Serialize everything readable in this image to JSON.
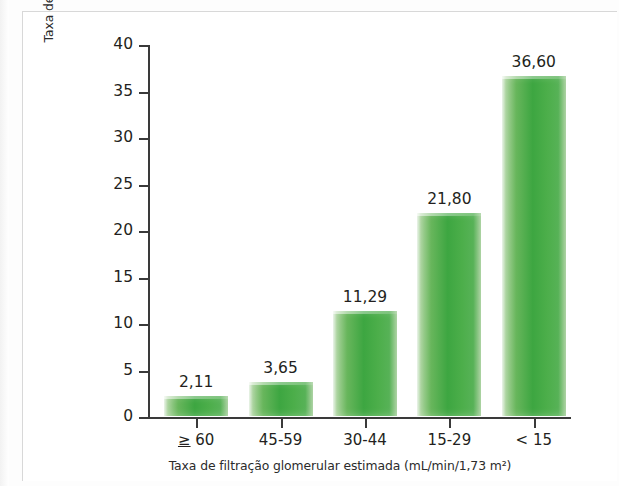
{
  "chart_data": {
    "type": "bar",
    "title": "",
    "categories": [
      "≥ 60",
      "45-59",
      "30-44",
      "15-29",
      "< 15"
    ],
    "values": [
      2.11,
      3.65,
      11.29,
      21.8,
      36.6
    ],
    "value_labels": [
      "2,11",
      "3,65",
      "11,29",
      "21,80",
      "36,60"
    ],
    "xlabel": "Taxa de filtração glomerular estimada (mL/min/1,73 m²)",
    "ylabel": "Taxa de eventos cardiovasculares ajustados para a idade\n(100 pessoas/ano)",
    "ylim": [
      0,
      40
    ],
    "ytick_labels": [
      "0",
      "5",
      "10",
      "15",
      "20",
      "25",
      "30",
      "35",
      "40"
    ],
    "ytick_values": [
      0,
      5,
      10,
      15,
      20,
      25,
      30,
      35,
      40
    ],
    "grid": false,
    "legend": null,
    "bar_color": "#4cae4a",
    "axis_color": "#3a3a3a",
    "text_color": "#231f20"
  }
}
